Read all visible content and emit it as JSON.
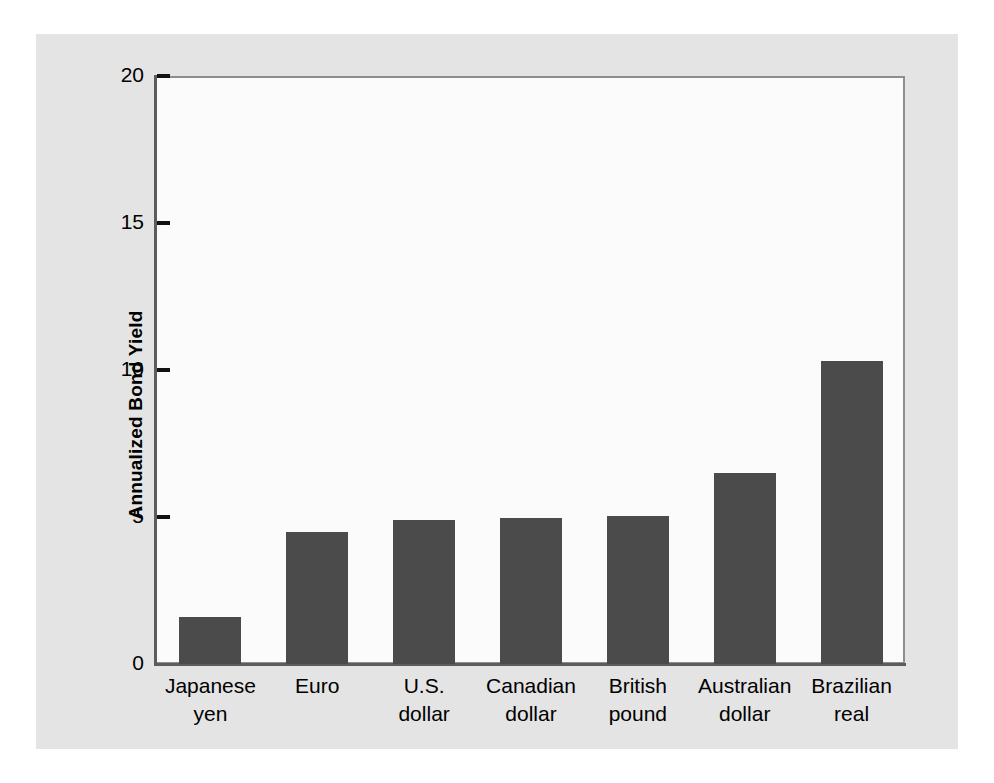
{
  "chart_data": {
    "type": "bar",
    "title": "",
    "xlabel": "",
    "ylabel": "Annualized Bond Yield",
    "ylim": [
      0,
      20
    ],
    "yticks": [
      0,
      5,
      10,
      15,
      20
    ],
    "ytick_labels": [
      "0",
      "5",
      "10",
      "15",
      "20"
    ],
    "grid": false,
    "legend": "none",
    "bar_color": "#4b4b4b",
    "plot_background": "#fbfbfb",
    "panel_background": "#e4e4e4",
    "categories": [
      "Japanese yen",
      "Euro",
      "U.S. dollar",
      "Canadian dollar",
      "British pound",
      "Australian dollar",
      "Brazilian real"
    ],
    "category_lines": [
      [
        "Japanese",
        "yen"
      ],
      [
        "Euro",
        ""
      ],
      [
        "U.S.",
        "dollar"
      ],
      [
        "Canadian",
        "dollar"
      ],
      [
        "British",
        "pound"
      ],
      [
        "Australian",
        "dollar"
      ],
      [
        "Brazilian",
        "real"
      ]
    ],
    "values": [
      1.6,
      4.5,
      4.9,
      4.95,
      5.05,
      6.5,
      10.3
    ]
  }
}
